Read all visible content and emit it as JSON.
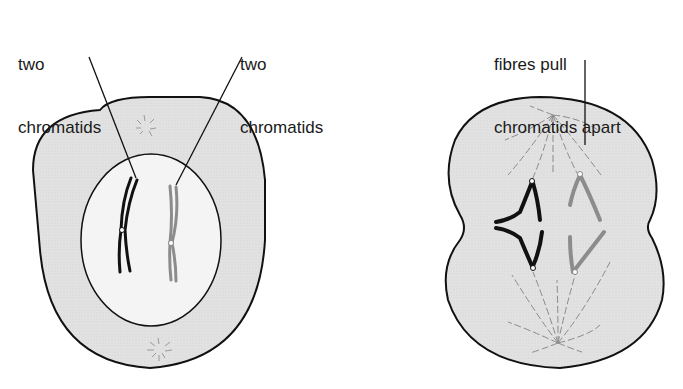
{
  "labels": {
    "left_chromatids_line1": "two",
    "left_chromatids_line2": "chromatids",
    "right_chromatids_line1": "two",
    "right_chromatids_line2": "chromatids",
    "fibres_line1": "fibres pull",
    "fibres_line2": "chromatids apart"
  },
  "colors": {
    "cytoplasm": "#e4e4e4",
    "nucleus": "#f3f3f3",
    "outline": "#111111",
    "dark_chromosome": "#111111",
    "light_chromosome": "#8c8c8c",
    "fibre": "#8a8a8a"
  },
  "cells": [
    {
      "name": "cell-with-nucleus",
      "stage": "chromosomes condensed, two chromatids each"
    },
    {
      "name": "dividing-cell",
      "stage": "fibres pull chromatids apart"
    }
  ]
}
